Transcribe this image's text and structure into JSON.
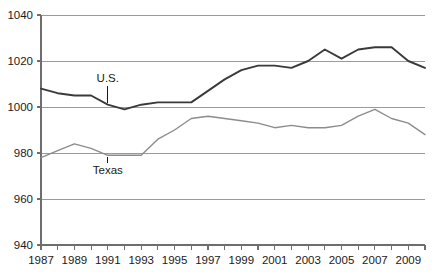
{
  "chart_data": {
    "type": "line",
    "title": "",
    "subtitle": "",
    "xlabel": "",
    "ylabel": "",
    "xlim": [
      1987,
      2010
    ],
    "ylim": [
      940,
      1040
    ],
    "grid": true,
    "legend_position": "inline-annotations",
    "y_ticks": [
      1040,
      1020,
      1000,
      980,
      960,
      940
    ],
    "x_ticks": [
      1987,
      1988,
      1989,
      1990,
      1991,
      1992,
      1993,
      1994,
      1995,
      1996,
      1997,
      1998,
      1999,
      2000,
      2001,
      2002,
      2003,
      2004,
      2005,
      2006,
      2007,
      2008,
      2009,
      2010
    ],
    "x_tick_labels": [
      "1987",
      "",
      "1989",
      "",
      "1991",
      "",
      "1993",
      "",
      "1995",
      "",
      "1997",
      "",
      "1999",
      "",
      "2001",
      "",
      "2003",
      "",
      "2005",
      "",
      "2007",
      "",
      "2009",
      ""
    ],
    "x": [
      1987,
      1988,
      1989,
      1990,
      1991,
      1992,
      1993,
      1994,
      1995,
      1996,
      1997,
      1998,
      1999,
      2000,
      2001,
      2002,
      2003,
      2004,
      2005,
      2006,
      2007,
      2008,
      2009,
      2010
    ],
    "series": [
      {
        "name": "U.S.",
        "color": "#3a3a3a",
        "values": [
          1008,
          1006,
          1005,
          1005,
          1001,
          999,
          1001,
          1002,
          1002,
          1002,
          1007,
          1012,
          1016,
          1018,
          1018,
          1017,
          1020,
          1025,
          1021,
          1025,
          1026,
          1026,
          1020,
          1017
        ]
      },
      {
        "name": "Texas",
        "color": "#8c8c8c",
        "values": [
          978,
          981,
          984,
          982,
          979,
          979,
          979,
          986,
          990,
          995,
          996,
          995,
          994,
          993,
          991,
          992,
          991,
          991,
          992,
          996,
          999,
          995,
          993,
          988
        ]
      }
    ],
    "annotations": [
      {
        "text": "U.S.",
        "series": "U.S.",
        "x": 1991,
        "label_y": 1011,
        "leader": true
      },
      {
        "text": "Texas",
        "series": "Texas",
        "x": 1991,
        "label_y": 971,
        "leader": true
      }
    ]
  },
  "colors": {
    "axis": "#6e6e6e",
    "grid": "#9a9a9a",
    "text": "#1a1a1a",
    "us_line": "#3a3a3a",
    "texas_line": "#8c8c8c",
    "background": "#ffffff"
  }
}
